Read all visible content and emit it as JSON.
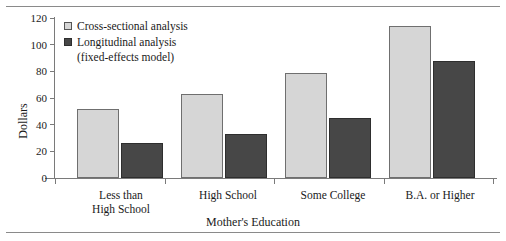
{
  "chart_data": {
    "type": "bar",
    "title": "",
    "xlabel": "Mother's Education",
    "ylabel": "Dollars",
    "ylim": [
      0,
      120
    ],
    "yticks": [
      0,
      20,
      40,
      60,
      80,
      100,
      120
    ],
    "grid": false,
    "legend_position": "top-left",
    "categories": [
      "Less than\nHigh School",
      "High School",
      "Some College",
      "B.A. or Higher"
    ],
    "category_lines": [
      [
        "Less than",
        "High School"
      ],
      [
        "High School"
      ],
      [
        "Some College"
      ],
      [
        "B.A. or Higher"
      ]
    ],
    "series": [
      {
        "name": "Cross-sectional analysis",
        "color": "#d6d6d6",
        "values": [
          52,
          63,
          79,
          114
        ]
      },
      {
        "name": "Longitudinal analysis (fixed-effects model)",
        "color": "#474747",
        "values": [
          26,
          33,
          45,
          88
        ]
      }
    ]
  },
  "legend": {
    "item1": "Cross-sectional analysis",
    "item2": "Longitudinal analysis",
    "item2_sub": "(fixed-effects model)"
  },
  "axis": {
    "y_title": "Dollars",
    "x_title": "Mother's Education",
    "y_0": "0",
    "y_20": "20",
    "y_40": "40",
    "y_60": "60",
    "y_80": "80",
    "y_100": "100",
    "y_120": "120"
  },
  "categories": {
    "c0_l0": "Less than",
    "c0_l1": "High School",
    "c1_l0": "High School",
    "c2_l0": "Some College",
    "c3_l0": "B.A. or Higher"
  }
}
